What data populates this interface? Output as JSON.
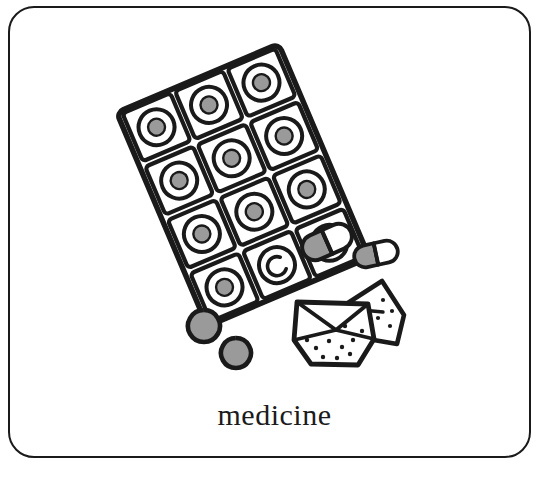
{
  "card": {
    "caption": "medicine",
    "border_color": "#1a1a1a",
    "background_color": "#ffffff"
  },
  "illustration": {
    "name": "medicine-illustration",
    "description": "hand drawn line art of medicines",
    "ink_color": "#1a1a1a",
    "pill_fill_color": "#9a9a9a",
    "capsule_cap_color": "#ffffff",
    "objects": [
      {
        "name": "blister-pack",
        "type": "blister-pack",
        "rotation_deg": -23,
        "columns": 3,
        "rows": 4,
        "total_cells": 12,
        "filled_cells": 10,
        "empty_cells": 2,
        "empty_cell_marker": "crescent"
      },
      {
        "name": "capsule-1",
        "type": "capsule",
        "rotation_deg": -22,
        "body_color": "#9a9a9a",
        "cap_color": "#ffffff"
      },
      {
        "name": "capsule-2",
        "type": "capsule",
        "rotation_deg": -12,
        "body_color": "#9a9a9a",
        "cap_color": "#ffffff"
      },
      {
        "name": "tablet-1",
        "type": "round-tablet",
        "fill_color": "#9a9a9a"
      },
      {
        "name": "tablet-2",
        "type": "round-tablet",
        "fill_color": "#9a9a9a"
      },
      {
        "name": "powder-packet",
        "type": "folded-paper-packet",
        "powder_dots": 14
      }
    ]
  }
}
